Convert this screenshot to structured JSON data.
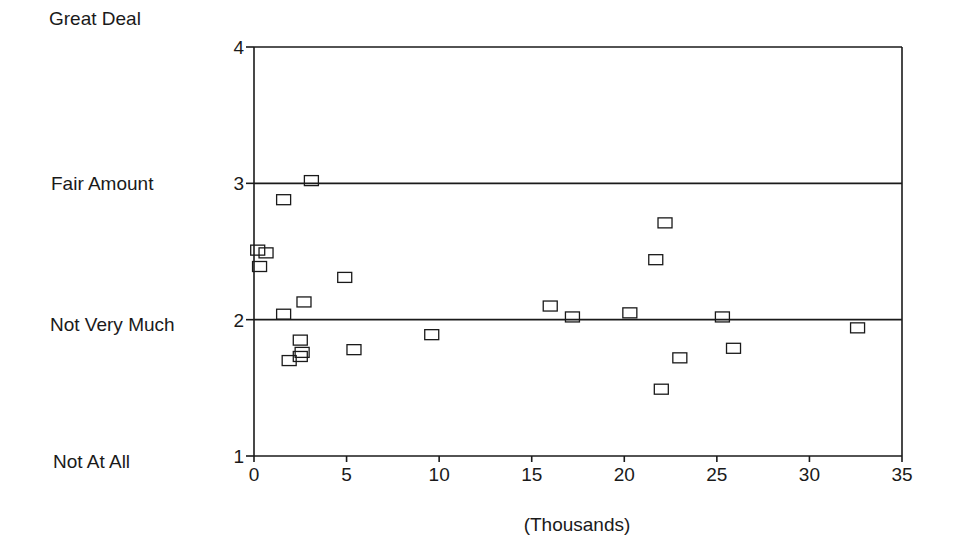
{
  "chart_data": {
    "type": "scatter",
    "title": "",
    "xlabel": "(Thousands)",
    "ylabel": "",
    "xlim": [
      0,
      35
    ],
    "ylim": [
      1,
      4
    ],
    "x_ticks": [
      0,
      5,
      10,
      15,
      20,
      25,
      30,
      35
    ],
    "y_ticks": [
      1,
      2,
      3,
      4
    ],
    "y_category_labels": [
      {
        "value": 4,
        "label": "Great Deal"
      },
      {
        "value": 3,
        "label": "Fair Amount"
      },
      {
        "value": 2,
        "label": "Not Very Much"
      },
      {
        "value": 1,
        "label": "Not At All"
      }
    ],
    "reference_lines_y": [
      2,
      3
    ],
    "grid": false,
    "legend": null,
    "marker": "open-square",
    "series": [
      {
        "name": "points",
        "points": [
          {
            "x": 3.1,
            "y": 3.02
          },
          {
            "x": 1.6,
            "y": 2.88
          },
          {
            "x": 0.2,
            "y": 2.51
          },
          {
            "x": 0.65,
            "y": 2.49
          },
          {
            "x": 0.3,
            "y": 2.39
          },
          {
            "x": 4.9,
            "y": 2.31
          },
          {
            "x": 2.7,
            "y": 2.13
          },
          {
            "x": 1.6,
            "y": 2.04
          },
          {
            "x": 2.5,
            "y": 1.85
          },
          {
            "x": 2.6,
            "y": 1.76
          },
          {
            "x": 2.5,
            "y": 1.73
          },
          {
            "x": 1.9,
            "y": 1.7
          },
          {
            "x": 5.4,
            "y": 1.78
          },
          {
            "x": 9.6,
            "y": 1.89
          },
          {
            "x": 16.0,
            "y": 2.1
          },
          {
            "x": 17.2,
            "y": 2.02
          },
          {
            "x": 22.2,
            "y": 2.71
          },
          {
            "x": 21.7,
            "y": 2.44
          },
          {
            "x": 20.3,
            "y": 2.05
          },
          {
            "x": 25.3,
            "y": 2.02
          },
          {
            "x": 25.9,
            "y": 1.79
          },
          {
            "x": 23.0,
            "y": 1.72
          },
          {
            "x": 22.0,
            "y": 1.49
          },
          {
            "x": 32.6,
            "y": 1.94
          }
        ]
      }
    ]
  },
  "colors": {
    "ink": "#1a1a1a",
    "background": "#ffffff"
  }
}
